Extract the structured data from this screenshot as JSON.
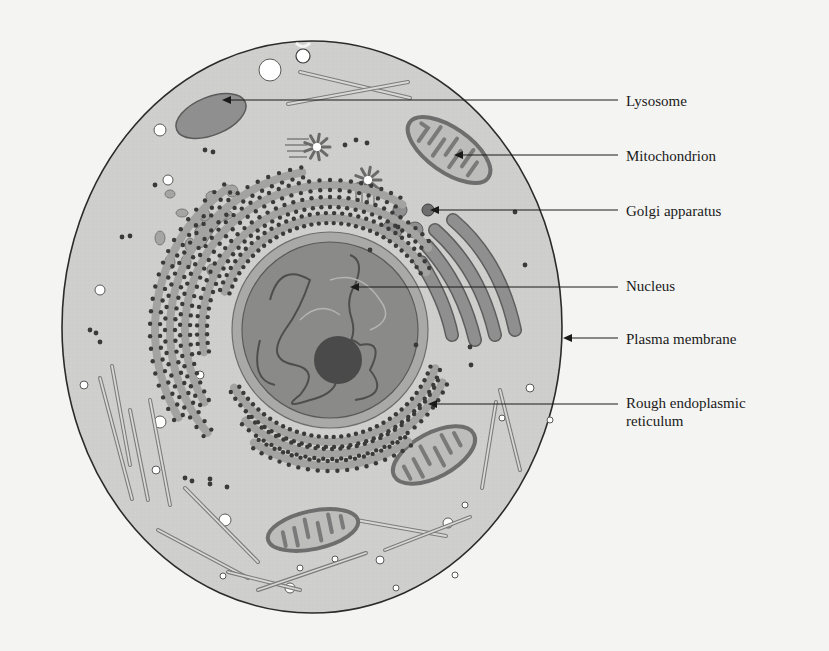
{
  "figure": {
    "colors": {
      "background": "#f4f4f2",
      "cytoplasm": "#cfcfcd",
      "membrane": "#2b2b2b",
      "organelle_fill": "#8f8f8f",
      "organelle_edge": "#5a5a5a",
      "nucleus_fill": "#8a8a88",
      "nuclear_envelope": "#a9a9a7",
      "nucleolus": "#4a4a4a",
      "ribosome": "#3a3a3a",
      "leader_line": "#1a1a1a"
    }
  },
  "labels": [
    {
      "id": "lysosome",
      "text": "Lysosome"
    },
    {
      "id": "mitochondrion",
      "text": "Mitochondrion"
    },
    {
      "id": "golgi",
      "text": "Golgi apparatus"
    },
    {
      "id": "nucleus",
      "text": "Nucleus"
    },
    {
      "id": "plasma-membrane",
      "text": "Plasma membrane"
    },
    {
      "id": "rough-er",
      "text": "Rough endoplasmic reticulum"
    }
  ]
}
